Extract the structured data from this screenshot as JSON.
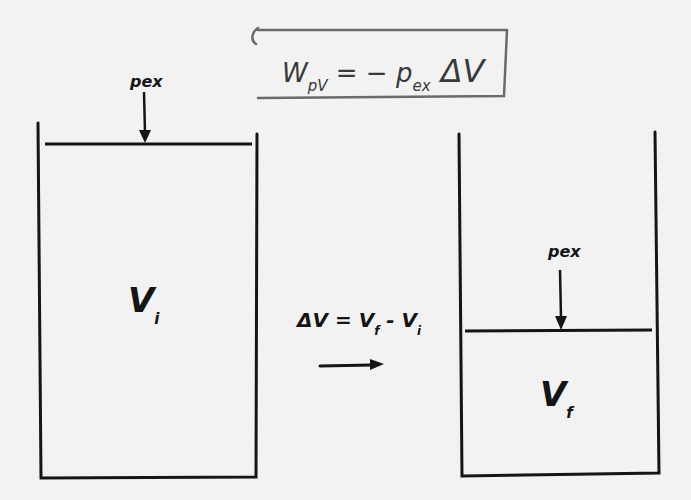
{
  "diagram": {
    "formula": {
      "lhs": "W",
      "lhs_sub": "pV",
      "equals": " = − ",
      "p": "p",
      "p_sub": "ex",
      "delta_v": " ΔV"
    },
    "left_container": {
      "volume_label": "V",
      "volume_sub": "i",
      "pressure_label": "p",
      "pressure_sub": "ex"
    },
    "process": {
      "equation_delta": "ΔV = V",
      "equation_f_sub": "f",
      "equation_minus": " - V",
      "equation_i_sub": "i"
    },
    "right_container": {
      "volume_label": "V",
      "volume_sub": "f",
      "pressure_label": "p",
      "pressure_sub": "ex"
    },
    "colors": {
      "ink": "#151515",
      "box": "#6a6a6a",
      "paper": "#f2f2f2"
    }
  }
}
